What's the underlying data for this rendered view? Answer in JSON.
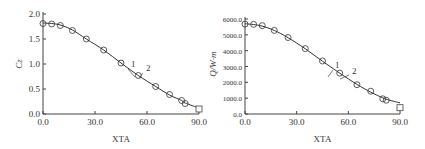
{
  "chart_data": [
    {
      "type": "line",
      "panel": "left",
      "title": "",
      "xlabel": "XTA",
      "ylabel": "C_z",
      "xlim": [
        0,
        90
      ],
      "ylim": [
        0,
        2.0
      ],
      "xticks": [
        "0.0",
        "30.0",
        "60.0",
        "90.0"
      ],
      "yticks": [
        "0.0",
        "0.5",
        "1.0",
        "1.5",
        "2.0"
      ],
      "grid": false,
      "legend": null,
      "annotations": [
        "1",
        "2"
      ],
      "series": [
        {
          "name": "1",
          "style": "line",
          "x": [
            0,
            5,
            10,
            17,
            25,
            35,
            45,
            55,
            65,
            73,
            80,
            82,
            90
          ],
          "values": [
            1.82,
            1.81,
            1.78,
            1.68,
            1.5,
            1.28,
            1.02,
            0.77,
            0.55,
            0.38,
            0.27,
            0.22,
            0.12
          ]
        },
        {
          "name": "2",
          "style": "markers",
          "marker": "circle",
          "x": [
            0,
            5,
            10,
            17,
            25,
            35,
            45,
            55,
            65,
            73,
            80,
            82,
            90
          ],
          "values": [
            1.81,
            1.8,
            1.77,
            1.67,
            1.5,
            1.28,
            1.02,
            0.77,
            0.55,
            0.39,
            0.27,
            0.21,
            0.1
          ]
        }
      ]
    },
    {
      "type": "line",
      "panel": "right",
      "title": "",
      "xlabel": "XTA",
      "ylabel": "Q/W·m",
      "xlim": [
        0,
        90
      ],
      "ylim": [
        0,
        6000
      ],
      "xticks": [
        "0.0",
        "30.0",
        "60.0",
        "90.0"
      ],
      "yticks": [
        "0.0",
        "1000.0",
        "2000.0",
        "3000.0",
        "4000.0",
        "5000.0",
        "6000.0"
      ],
      "grid": false,
      "legend": null,
      "annotations": [
        "1",
        "2"
      ],
      "series": [
        {
          "name": "1",
          "style": "line",
          "x": [
            0,
            5,
            10,
            17,
            25,
            35,
            45,
            55,
            65,
            73,
            80,
            82,
            90
          ],
          "values": [
            5700,
            5650,
            5550,
            5280,
            4820,
            4120,
            3330,
            2580,
            1870,
            1380,
            1020,
            930,
            700
          ]
        },
        {
          "name": "2",
          "style": "markers",
          "marker": "circle",
          "x": [
            0,
            5,
            10,
            17,
            25,
            35,
            45,
            55,
            65,
            73,
            80,
            82,
            90
          ],
          "values": [
            5680,
            5660,
            5580,
            5280,
            4830,
            4130,
            3350,
            2580,
            1850,
            1440,
            960,
            870,
            400
          ]
        }
      ]
    }
  ]
}
